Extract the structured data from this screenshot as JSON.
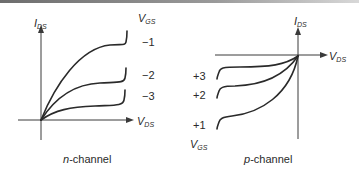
{
  "figure": {
    "top_rule": true,
    "panels": [
      {
        "id": "n-channel",
        "caption_italic": "n",
        "caption_rest": "-channel",
        "y_axis_label": {
          "main": "I",
          "sub": "DS"
        },
        "x_axis_label": {
          "main": "V",
          "sub": "DS"
        },
        "curve_param_label": {
          "main": "V",
          "sub": "GS"
        },
        "curves": [
          {
            "label": "−1"
          },
          {
            "label": "−2"
          },
          {
            "label": "−3"
          }
        ]
      },
      {
        "id": "p-channel",
        "caption_italic": "p",
        "caption_rest": "-channel",
        "y_axis_label": {
          "main": "I",
          "sub": "DS"
        },
        "x_axis_label": {
          "main": "V",
          "sub": "DS"
        },
        "curve_param_label": {
          "main": "V",
          "sub": "GS"
        },
        "curves": [
          {
            "label": "+3"
          },
          {
            "label": "+2"
          },
          {
            "label": "+1"
          }
        ]
      }
    ],
    "colors": {
      "ink": "#2a2a2a",
      "background": "#ffffff"
    }
  }
}
